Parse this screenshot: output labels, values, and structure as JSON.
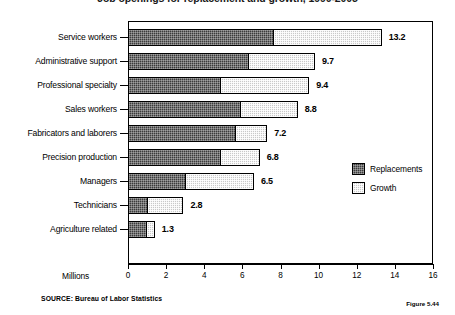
{
  "chart": {
    "title": "Job openings for replacement and growth, 1990-2005",
    "xlabel": "Millions",
    "source_note": "SOURCE: Bureau of Labor Statistics",
    "figure_caption": "Figure 5.44"
  },
  "legend": {
    "position": "inside-right",
    "entries": [
      {
        "label": "Replacements",
        "color": "#3b3b3b"
      },
      {
        "label": "Growth",
        "color": "#c9c9c9"
      }
    ]
  },
  "chart_data": {
    "type": "bar",
    "orientation": "horizontal",
    "stacked": true,
    "title": "Job openings for replacement and growth, 1990-2005",
    "xlabel": "Millions",
    "ylabel": "",
    "xlim": [
      0,
      16
    ],
    "xticks": [
      0,
      2,
      4,
      6,
      8,
      10,
      12,
      14,
      16
    ],
    "xtick_labels": [
      "0",
      "2",
      "4",
      "6",
      "8",
      "10",
      "12",
      "14",
      "16"
    ],
    "grid": false,
    "categories": [
      "Service workers",
      "Administrative support",
      "Professional specialty",
      "Sales workers",
      "Fabricators and laborers",
      "Precision production",
      "Managers",
      "Technicians",
      "Agriculture related"
    ],
    "series": [
      {
        "name": "Replacements",
        "color": "#3b3b3b",
        "values": [
          7.6,
          6.3,
          4.8,
          5.9,
          5.6,
          4.8,
          3.0,
          1.0,
          0.95
        ]
      },
      {
        "name": "Growth",
        "color": "#c9c9c9",
        "values": [
          5.6,
          3.4,
          4.6,
          2.9,
          1.6,
          2.0,
          3.5,
          1.8,
          0.35
        ]
      }
    ],
    "totals": [
      13.2,
      9.7,
      9.4,
      8.8,
      7.2,
      6.8,
      6.5,
      2.8,
      1.3
    ],
    "total_labels": [
      "13.2",
      "9.7",
      "9.4",
      "8.8",
      "7.2",
      "6.8",
      "6.5",
      "2.8",
      "1.3"
    ]
  }
}
